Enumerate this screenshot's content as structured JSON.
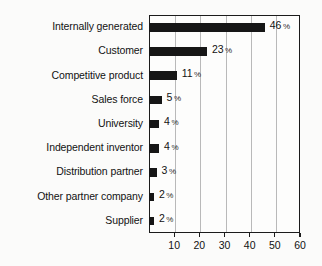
{
  "chart_data": {
    "type": "bar",
    "orientation": "horizontal",
    "title": "",
    "subtitle": "",
    "xlabel": "",
    "ylabel": "",
    "categories": [
      "Internally generated",
      "Customer",
      "Competitive product",
      "Sales force",
      "University",
      "Independent inventor",
      "Distribution partner",
      "Other partner company",
      "Supplier"
    ],
    "values": [
      46,
      23,
      11,
      5,
      4,
      4,
      3,
      2,
      2
    ],
    "value_suffix": "%",
    "value_labels": [
      "46",
      "23",
      "11",
      "5",
      "4",
      "4",
      "3",
      "2",
      "2"
    ],
    "xlim": [
      0,
      60
    ],
    "xticks": [
      10,
      20,
      30,
      40,
      50,
      60
    ],
    "xtick_labels": [
      "10",
      "20",
      "30",
      "40",
      "50",
      "60"
    ],
    "gridlines": [
      10,
      20,
      30,
      40,
      50
    ],
    "grid": true,
    "legend": null,
    "bar_color": "#161616",
    "grid_color": "#b9b9b9",
    "frame_color": "#1b1b1b",
    "background_color": "#fbfbfa",
    "text_color": "#121212"
  }
}
